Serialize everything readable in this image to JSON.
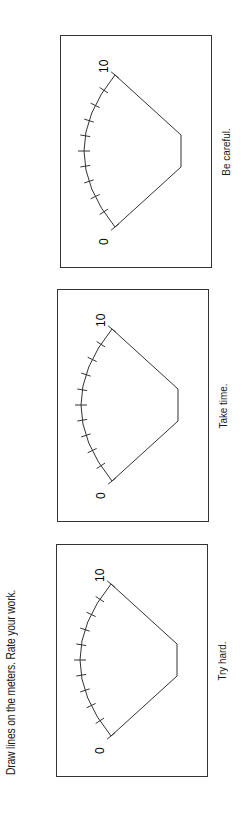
{
  "instruction": "Draw lines on the meters. Rate your work.",
  "scale": {
    "min_label": "0",
    "max_label": "10",
    "tick_count": 11
  },
  "meters": [
    {
      "caption": "Try hard."
    },
    {
      "caption": "Take time."
    },
    {
      "caption": "Be careful."
    }
  ],
  "colors": {
    "ink": "#1a1a1a",
    "border": "#333333",
    "background": "#ffffff"
  }
}
